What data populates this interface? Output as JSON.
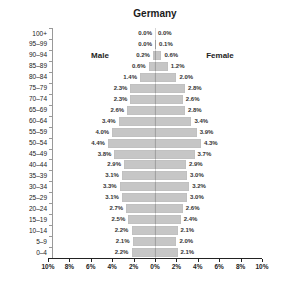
{
  "title": "Germany",
  "left_group_label": "Male",
  "right_group_label": "Female",
  "chart_data": {
    "type": "bar",
    "subtype": "population_pyramid",
    "title": "Germany",
    "orientation": "horizontal",
    "left_series_label": "Male",
    "right_series_label": "Female",
    "categories_top_to_bottom": [
      "100+",
      "95–99",
      "90–94",
      "85–89",
      "80–84",
      "75–79",
      "70–74",
      "65–69",
      "60–64",
      "55–59",
      "50–54",
      "45–49",
      "40–44",
      "35–39",
      "30–34",
      "25–29",
      "20–24",
      "15–19",
      "10–14",
      "5–9",
      "0–4"
    ],
    "series": [
      {
        "name": "Male",
        "side": "left",
        "values": [
          0.0,
          0.0,
          0.2,
          0.6,
          1.4,
          2.3,
          2.3,
          2.6,
          3.4,
          4.0,
          4.4,
          3.8,
          2.9,
          3.1,
          3.3,
          3.1,
          2.7,
          2.5,
          2.2,
          2.1,
          2.2
        ],
        "labels": [
          "0.0%",
          "0.0%",
          "0.2%",
          "0.6%",
          "1.4%",
          "2.3%",
          "2.3%",
          "2.6%",
          "3.4%",
          "4.0%",
          "4.4%",
          "3.8%",
          "2.9%",
          "3.1%",
          "3.3%",
          "3.1%",
          "2.7%",
          "2.5%",
          "2.2%",
          "2.1%",
          "2.2%"
        ]
      },
      {
        "name": "Female",
        "side": "right",
        "values": [
          0.0,
          0.1,
          0.6,
          1.2,
          2.0,
          2.8,
          2.6,
          2.8,
          3.4,
          3.9,
          4.3,
          3.7,
          2.9,
          3.0,
          3.2,
          3.0,
          2.6,
          2.4,
          2.1,
          2.0,
          2.1
        ],
        "labels": [
          "0.0%",
          "0.1%",
          "0.6%",
          "1.2%",
          "2.0%",
          "2.8%",
          "2.6%",
          "2.8%",
          "3.4%",
          "3.9%",
          "4.3%",
          "3.7%",
          "2.9%",
          "3.0%",
          "3.2%",
          "3.0%",
          "2.6%",
          "2.4%",
          "2.1%",
          "2.0%",
          "2.1%"
        ]
      }
    ],
    "x_axis": {
      "tick_labels": [
        "10%",
        "8%",
        "6%",
        "4%",
        "2%",
        "0%",
        "2%",
        "4%",
        "6%",
        "8%",
        "10%"
      ],
      "max_percent_each_side": 10,
      "tick_step_percent": 2,
      "unit": "%"
    },
    "bar_color": "#c6c6c6",
    "center_line": true,
    "grid": false,
    "legend_position": "none"
  }
}
